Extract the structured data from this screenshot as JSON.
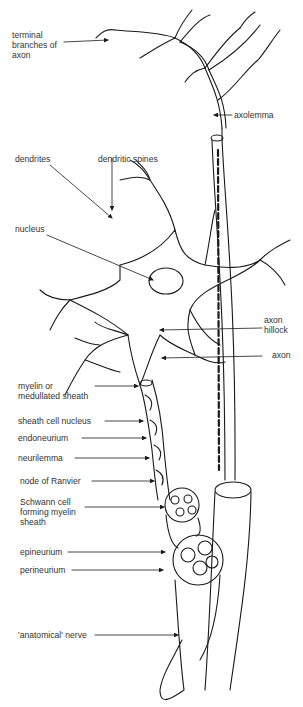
{
  "diagram": {
    "labels": {
      "terminal_branches": "terminal\nbranches of\naxon",
      "axolemma": "axolemma",
      "dendrites": "dendrites",
      "dendritic_spines": "dendritic spines",
      "nucleus": "nucleus",
      "axon_hillock": "axon\nhillock",
      "axon": "axon",
      "myelin_sheath": "myelin or\nmedullated sheath",
      "sheath_cell_nucleus": "sheath cell nucleus",
      "endoneurium": "endoneurium",
      "neurilemma": "neurilemma",
      "node_of_ranvier": "node of Ranvier",
      "schwann_cell": "Schwann cell\nforming myelin\nsheath",
      "epineurium": "epineurium",
      "perineurium": "perineurium",
      "anatomical_nerve": "'anatomical' nerve"
    },
    "colors": {
      "ink": "#1a1a1a",
      "label": "#333333",
      "background": "#ffffff"
    }
  }
}
